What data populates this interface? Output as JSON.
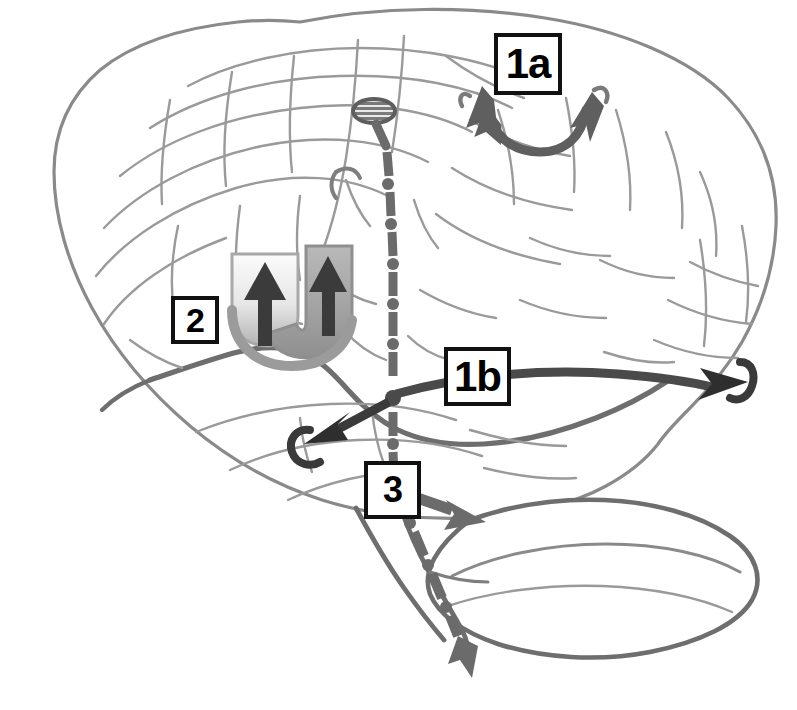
{
  "figure": {
    "name": "brain-connectivity-schematic",
    "background_color": "#ffffff",
    "width": 797,
    "height": 710
  },
  "labels": [
    {
      "id": "1a",
      "text": "1a",
      "description": "boxed label for the short arcuate double-headed arrow over the superior parietal / postcentral region",
      "x": 494,
      "y": 33,
      "width": 68,
      "height": 62
    },
    {
      "id": "2",
      "text": "2",
      "description": "boxed label for the shaded U-shaped structure with two upward arrows",
      "x": 171,
      "y": 296,
      "width": 48,
      "height": 48
    },
    {
      "id": "1b",
      "text": "1b",
      "description": "boxed label for the long horizontal bidirectional pathway running anterior-posterior",
      "x": 444,
      "y": 347,
      "width": 67,
      "height": 59
    },
    {
      "id": "3",
      "text": "3",
      "description": "boxed label for the descending dash-dot tract branching toward the cerebellum and brainstem",
      "x": 364,
      "y": 461,
      "width": 57,
      "height": 58
    }
  ],
  "anatomy": {
    "structures": [
      "cerebral-hemisphere-lateral-outline",
      "gyri-and-sulci-lines",
      "sylvian-fissure",
      "cerebellum",
      "brainstem"
    ],
    "outline_color": "#8a8a8a",
    "sulci_color": "#9a9a9a",
    "major_fissure_color": "#6e6e6e"
  },
  "pathways": [
    {
      "name": "arcuate-double-arrow-1a",
      "style": "solid-curved-double-headed",
      "color": "#5f5f5f",
      "label_ref": "1a"
    },
    {
      "name": "u-shaped-fiber-bundle-2",
      "style": "filled-u-shape-with-two-up-arrows",
      "color_left_limb": "#cfcfcf",
      "color_right_limb": "#9e9e9e",
      "arrow_color": "#3b3b3b",
      "label_ref": "2"
    },
    {
      "name": "horizontal-bidirectional-tract-1b",
      "style": "solid-straight-double-headed-with-hooks",
      "color": "#4a4a4a",
      "label_ref": "1b"
    },
    {
      "name": "descending-dash-dot-tract-3",
      "style": "dash-dot-vertical-with-branch-arrows",
      "color": "#6b6b6b",
      "label_ref": "3"
    }
  ],
  "markers": [
    {
      "name": "striped-ellipse-node",
      "description": "hatched oval marker at the superior end of the descending dash-dot tract",
      "cx": 374,
      "cy": 111,
      "rx": 20,
      "ry": 11,
      "color": "#6f6f6f"
    },
    {
      "name": "central-junction-dot",
      "description": "dot where the horizontal tract crosses the descending tract",
      "cx": 393,
      "cy": 398,
      "r": 7,
      "color": "#4a4a4a"
    }
  ]
}
